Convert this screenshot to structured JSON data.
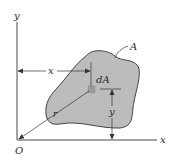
{
  "diagram": {
    "type": "area-element-geometry",
    "axes": {
      "x_label": "x",
      "y_label": "y",
      "origin_label": "O"
    },
    "region": {
      "label": "A",
      "fill": "#bcbcbc",
      "stroke": "#333333"
    },
    "element": {
      "label": "dA",
      "fill": "#9a9a9a"
    },
    "dimensions": {
      "horizontal_label": "x",
      "vertical_label": "y",
      "radial_label": "r"
    },
    "colors": {
      "background": "#ffffff",
      "line": "#333333",
      "text": "#2a2a2a"
    }
  }
}
